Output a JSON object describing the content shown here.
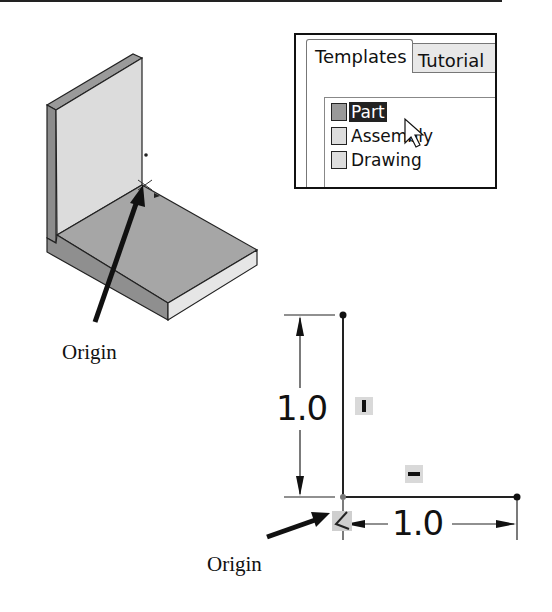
{
  "figure": {
    "top_rule": true,
    "part_model": {
      "description": "Isometric L-bracket part with origin marker",
      "origin_label": "Origin"
    },
    "templates_dialog": {
      "tabs": [
        {
          "label": "Templates",
          "active": true
        },
        {
          "label": "Tutorial",
          "active": false
        }
      ],
      "items": [
        {
          "label": "Part",
          "icon": "part-icon",
          "selected": true
        },
        {
          "label": "Assembly",
          "icon": "assembly-icon",
          "selected": false
        },
        {
          "label": "Drawing",
          "icon": "drawing-icon",
          "selected": false
        }
      ],
      "cursor": "pointer-arrow"
    },
    "sketch": {
      "vertical_dimension": "1.0",
      "horizontal_dimension": "1.0",
      "vertical_relation_glyph": "I",
      "horizontal_relation_glyph": "—",
      "origin_label": "Origin"
    }
  },
  "colors": {
    "ink": "#111111",
    "face_light": "#d8d8d8",
    "face_mid": "#a9a9a9",
    "face_dark": "#8c8c8c",
    "face_edge_light": "#e6e6e6",
    "selection": "#222222",
    "relation_box": "#d9d9d9"
  }
}
